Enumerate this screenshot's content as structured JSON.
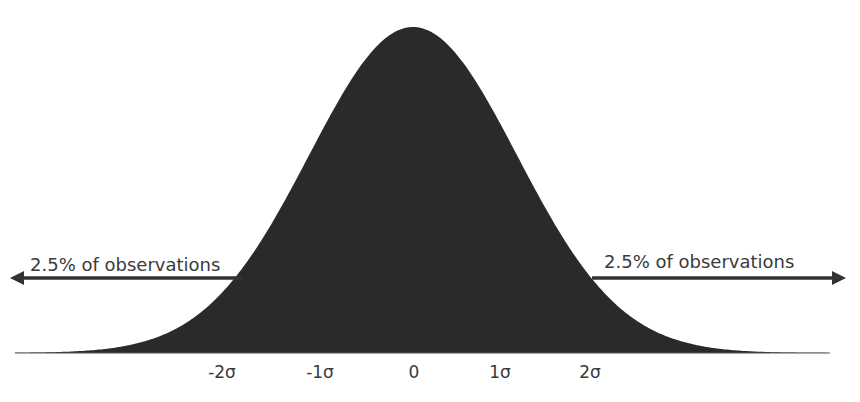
{
  "diagram": {
    "type": "normal-distribution",
    "colors": {
      "background": "#ffffff",
      "curve_fill": "#2a2a2a",
      "arrow": "#333333",
      "text": "#3a3a3a",
      "baseline": "#555555"
    },
    "left_annotation": {
      "label": "2.5% of observations",
      "direction": "left"
    },
    "right_annotation": {
      "label": "2.5% of observations",
      "direction": "right"
    },
    "axis_labels": [
      "-2σ",
      "-1σ",
      "0",
      "1σ",
      "2σ"
    ]
  },
  "chart_data": {
    "type": "area",
    "title": "",
    "distribution": "normal",
    "mean": 0,
    "x_ticks": [
      "-2σ",
      "-1σ",
      "0",
      "1σ",
      "2σ"
    ],
    "annotations": [
      {
        "text": "2.5% of observations",
        "position": "left tail",
        "arrow": "left"
      },
      {
        "text": "2.5% of observations",
        "position": "right tail",
        "arrow": "right"
      }
    ],
    "grid": false,
    "legend": null
  }
}
